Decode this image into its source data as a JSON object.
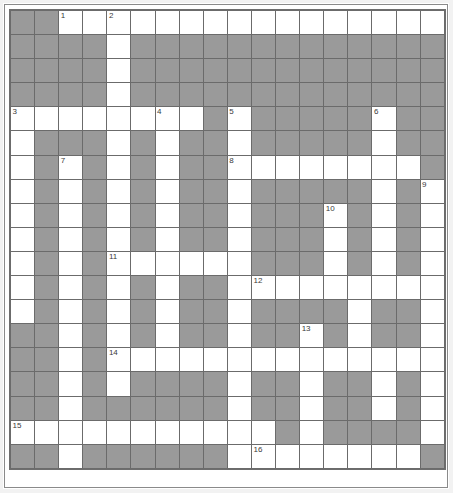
{
  "puzzle": {
    "type": "crossword-grid",
    "columns": 18,
    "rows": 19,
    "cell_size_px": 24,
    "colors": {
      "open_cell": "#ffffff",
      "blocked_cell": "#9a9a9a",
      "grid_line": "#6b6b6b",
      "clue_number_text": "#3a3a3a",
      "page_background": "#ffffff"
    },
    "legend": {
      "open_label": "open cell",
      "blocked_label": "blocked cell"
    },
    "clue_numbers": [
      {
        "number": "1",
        "row": 0,
        "col": 2
      },
      {
        "number": "2",
        "row": 0,
        "col": 4
      },
      {
        "number": "3",
        "row": 4,
        "col": 0
      },
      {
        "number": "4",
        "row": 4,
        "col": 6
      },
      {
        "number": "5",
        "row": 4,
        "col": 9
      },
      {
        "number": "6",
        "row": 4,
        "col": 15
      },
      {
        "number": "7",
        "row": 6,
        "col": 2
      },
      {
        "number": "8",
        "row": 6,
        "col": 9
      },
      {
        "number": "9",
        "row": 7,
        "col": 17
      },
      {
        "number": "10",
        "row": 8,
        "col": 13
      },
      {
        "number": "11",
        "row": 10,
        "col": 4
      },
      {
        "number": "12",
        "row": 11,
        "col": 10
      },
      {
        "number": "13",
        "row": 13,
        "col": 12
      },
      {
        "number": "14",
        "row": 14,
        "col": 4
      },
      {
        "number": "15",
        "row": 17,
        "col": 0
      },
      {
        "number": "16",
        "row": 18,
        "col": 10
      }
    ],
    "grid": [
      [
        "block",
        "block",
        "open",
        "open",
        "open",
        "open",
        "open",
        "open",
        "open",
        "open",
        "open",
        "open",
        "open",
        "open",
        "open",
        "open",
        "open",
        "open"
      ],
      [
        "block",
        "block",
        "block",
        "block",
        "open",
        "block",
        "block",
        "block",
        "block",
        "block",
        "block",
        "block",
        "block",
        "block",
        "block",
        "block",
        "block",
        "block"
      ],
      [
        "block",
        "block",
        "block",
        "block",
        "open",
        "block",
        "block",
        "block",
        "block",
        "block",
        "block",
        "block",
        "block",
        "block",
        "block",
        "block",
        "block",
        "block"
      ],
      [
        "block",
        "block",
        "block",
        "block",
        "open",
        "block",
        "block",
        "block",
        "block",
        "block",
        "block",
        "block",
        "block",
        "block",
        "block",
        "block",
        "block",
        "block"
      ],
      [
        "open",
        "open",
        "open",
        "open",
        "open",
        "open",
        "open",
        "open",
        "block",
        "open",
        "block",
        "block",
        "block",
        "block",
        "block",
        "open",
        "block",
        "block"
      ],
      [
        "open",
        "block",
        "block",
        "block",
        "open",
        "block",
        "open",
        "block",
        "block",
        "open",
        "block",
        "block",
        "block",
        "block",
        "block",
        "open",
        "block",
        "block"
      ],
      [
        "open",
        "block",
        "open",
        "block",
        "open",
        "block",
        "open",
        "block",
        "block",
        "open",
        "open",
        "open",
        "open",
        "open",
        "open",
        "open",
        "open",
        "block"
      ],
      [
        "open",
        "block",
        "open",
        "block",
        "open",
        "block",
        "open",
        "block",
        "block",
        "open",
        "block",
        "block",
        "block",
        "block",
        "block",
        "open",
        "block",
        "open"
      ],
      [
        "open",
        "block",
        "open",
        "block",
        "open",
        "block",
        "open",
        "block",
        "block",
        "open",
        "block",
        "block",
        "block",
        "open",
        "block",
        "open",
        "block",
        "open"
      ],
      [
        "open",
        "block",
        "open",
        "block",
        "open",
        "block",
        "open",
        "block",
        "block",
        "open",
        "block",
        "block",
        "block",
        "open",
        "block",
        "open",
        "block",
        "open"
      ],
      [
        "open",
        "block",
        "open",
        "block",
        "open",
        "open",
        "open",
        "open",
        "open",
        "open",
        "block",
        "block",
        "block",
        "open",
        "block",
        "open",
        "block",
        "open"
      ],
      [
        "open",
        "block",
        "open",
        "block",
        "open",
        "block",
        "open",
        "block",
        "block",
        "open",
        "open",
        "open",
        "open",
        "open",
        "open",
        "open",
        "open",
        "open"
      ],
      [
        "open",
        "block",
        "open",
        "block",
        "open",
        "block",
        "open",
        "block",
        "block",
        "open",
        "block",
        "block",
        "block",
        "block",
        "open",
        "block",
        "block",
        "open"
      ],
      [
        "block",
        "block",
        "open",
        "block",
        "open",
        "block",
        "open",
        "block",
        "block",
        "open",
        "block",
        "block",
        "open",
        "block",
        "open",
        "block",
        "block",
        "open"
      ],
      [
        "block",
        "block",
        "open",
        "block",
        "open",
        "open",
        "open",
        "open",
        "open",
        "open",
        "open",
        "open",
        "open",
        "open",
        "open",
        "open",
        "open",
        "open"
      ],
      [
        "block",
        "block",
        "open",
        "block",
        "open",
        "block",
        "block",
        "block",
        "block",
        "open",
        "block",
        "block",
        "open",
        "block",
        "block",
        "open",
        "block",
        "open"
      ],
      [
        "block",
        "block",
        "open",
        "block",
        "block",
        "block",
        "block",
        "block",
        "block",
        "open",
        "block",
        "block",
        "open",
        "block",
        "block",
        "open",
        "block",
        "open"
      ],
      [
        "open",
        "open",
        "open",
        "open",
        "open",
        "open",
        "open",
        "open",
        "open",
        "open",
        "open",
        "block",
        "open",
        "block",
        "block",
        "block",
        "block",
        "open"
      ],
      [
        "block",
        "block",
        "open",
        "block",
        "block",
        "block",
        "block",
        "block",
        "block",
        "open",
        "open",
        "open",
        "open",
        "open",
        "open",
        "open",
        "open",
        "block"
      ]
    ]
  }
}
